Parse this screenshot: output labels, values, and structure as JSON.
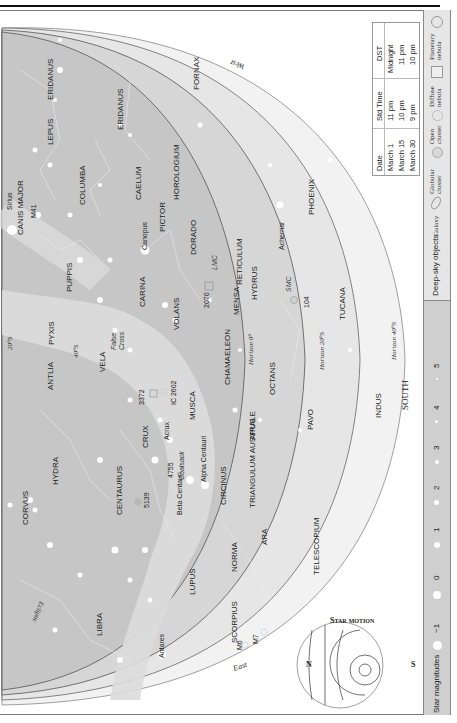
{
  "map": {
    "hemisphere_label": "SOUTH",
    "directions": {
      "west": "West",
      "east": "East",
      "south": "SOUTH"
    },
    "horizon_labels": [
      "Horizon 0°",
      "Horizon 20°S",
      "Horizon 40°S"
    ],
    "latitude_labels": [
      "20°S",
      "40°S"
    ],
    "ecliptic_label": "Ecliptic",
    "constellations": [
      "ERIDANUS",
      "ERIDANUS",
      "LEPUS",
      "FORNAX",
      "COLUMBA",
      "CAELUM",
      "HOROLOGIUM",
      "CANIS MAJOR",
      "PICTOR",
      "DORADO",
      "RETICULUM",
      "PHOENIX",
      "PUPPIS",
      "CARINA",
      "VOLANS",
      "MENSA",
      "HYDRUS",
      "TUCANA",
      "PYXIS",
      "ANTLIA",
      "VELA",
      "CHAMAELEON",
      "OCTANS",
      "MUSCA",
      "CRUX",
      "APUS",
      "PAVO",
      "INDUS",
      "HYDRA",
      "CENTAURUS",
      "CIRCINUS",
      "TRIANGULUM AUSTRALE",
      "CORVUS",
      "NORMA",
      "ARA",
      "TELESCOPIUM",
      "LIBRA",
      "LUPUS",
      "SCORPIUS"
    ],
    "stars": [
      "Sirius",
      "Canopus",
      "Achernar",
      "Acrux",
      "Alpha Centauri",
      "Beta Centauri",
      "Antares"
    ],
    "deep_sky": [
      "M41",
      "LMC",
      "SMC",
      "2070",
      "104",
      "3372",
      "IC 2602",
      "4755",
      "5139",
      "M6",
      "M7"
    ],
    "asterisms": [
      "False Cross",
      "Coalsack"
    ]
  },
  "date_table": {
    "headers": [
      "Date",
      "Std Time",
      "DST"
    ],
    "rows": [
      [
        "March 1",
        "11 pm",
        "Midnight"
      ],
      [
        "March 15",
        "10 pm",
        "11 pm"
      ],
      [
        "March 30",
        "9 pm",
        "10 pm"
      ]
    ]
  },
  "star_motion": {
    "title": "Star motion",
    "left": "N",
    "right": "S"
  },
  "legend": {
    "star_magnitudes_label": "Star magnitudes",
    "magnitudes": [
      "−1",
      "0",
      "1",
      "2",
      "3",
      "4",
      "5"
    ],
    "deep_sky_label": "Deep-sky objects",
    "deep_sky_types": [
      "Galaxy",
      "Globular cluster",
      "Open cluster",
      "Diffuse nebula",
      "Planetary nebula"
    ]
  }
}
